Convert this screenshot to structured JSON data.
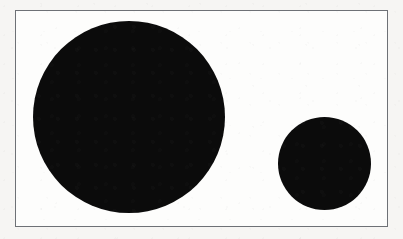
{
  "figure": {
    "kind": "scanned-figure",
    "page_background_color": "#f6f5f3",
    "plate_background_color": "#fdfdfc",
    "border_color": "#6e7176",
    "border_width_px": 1,
    "shape_fill_color": "#0b0b0b",
    "frame": {
      "label": "figure-border",
      "x": 15,
      "y": 10,
      "width": 373,
      "height": 217
    },
    "shapes": [
      {
        "name": "large-circle",
        "type": "circle",
        "label": "Large circle",
        "fill": "#0b0b0b",
        "center_x": 128,
        "center_y": 116,
        "diameter": 192,
        "radius": 96
      },
      {
        "name": "small-circle",
        "type": "circle",
        "label": "Small circle",
        "fill": "#0b0b0b",
        "center_x": 323,
        "center_y": 162,
        "diameter": 93,
        "radius": 46
      }
    ]
  },
  "chart_data": {
    "type": "scatter",
    "title": "",
    "subtitle": "",
    "xlabel": "",
    "ylabel": "",
    "grid": false,
    "legend": "none",
    "xlim": [
      0,
      373
    ],
    "ylim": [
      0,
      217
    ],
    "categories": [
      "Large circle",
      "Small circle"
    ],
    "values": [
      192,
      93
    ],
    "series": [
      {
        "name": "circle diameter (px)",
        "values": [
          192,
          93
        ]
      }
    ],
    "points": [
      {
        "label": "Large circle",
        "x": 113,
        "y": 106,
        "size": 192
      },
      {
        "label": "Small circle",
        "x": 308,
        "y": 152,
        "size": 93
      }
    ],
    "annotations": []
  }
}
